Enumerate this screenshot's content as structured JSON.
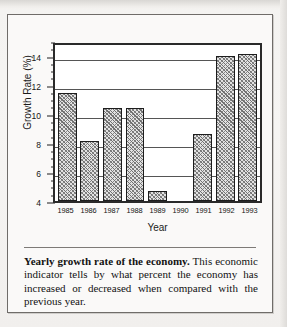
{
  "chart_data": {
    "type": "bar",
    "title": "",
    "xlabel": "Year",
    "ylabel": "Growth Rate (%)",
    "categories": [
      "1985",
      "1986",
      "1987",
      "1988",
      "1989",
      "1990",
      "1991",
      "1992",
      "1993"
    ],
    "values": [
      11.4,
      8.1,
      10.4,
      10.4,
      4.7,
      null,
      8.6,
      14.0,
      14.1
    ],
    "ylim": [
      4,
      15
    ],
    "ytick_labels": [
      "4",
      "6",
      "8",
      "10",
      "12",
      "14"
    ],
    "ytick_values": [
      4,
      6,
      8,
      10,
      12,
      14
    ],
    "gridlines": [
      6,
      8,
      10,
      12,
      14
    ],
    "grid": true,
    "legend": "none"
  },
  "caption": {
    "bold_lead": "Yearly growth rate of the economy.",
    "body": " This economic indicator tells by what percent the economy has increased or decreased when compared with the previous year."
  }
}
